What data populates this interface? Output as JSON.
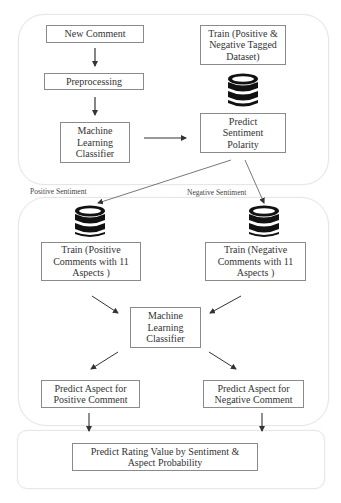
{
  "diagram": {
    "sections": {
      "sentiment_stage": {
        "new_comment": "New Comment",
        "preprocessing": "Preprocessing",
        "ml_classifier": "Machine\nLearning\nClassifier",
        "train_dataset": "Train (Positive &\nNegative Tagged\nDataset)",
        "predict_polarity": "Predict\nSentiment\nPolarity",
        "database_icon": "database-icon"
      },
      "branch_labels": {
        "positive": "Positive Sentiment",
        "negative": "Negative Sentiment"
      },
      "aspect_stage": {
        "train_positive": "Train (Positive\nComments with 11\nAspects )",
        "train_negative": "Train (Negative\nComments with 11\nAspects )",
        "ml_classifier": "Machine\nLearning\nClassifier",
        "predict_positive": "Predict Aspect for\nPositive Comment",
        "predict_negative": "Predict Aspect for\nNegative Comment",
        "database_icon": "database-icon"
      },
      "rating_stage": {
        "predict_rating": "Predict Rating Value by Sentiment &\nAspect Probability"
      }
    },
    "colors": {
      "box_border": "#8a8a8a",
      "container_border": "#e6e6e6",
      "arrow": "#333333",
      "database": "#111111"
    }
  }
}
